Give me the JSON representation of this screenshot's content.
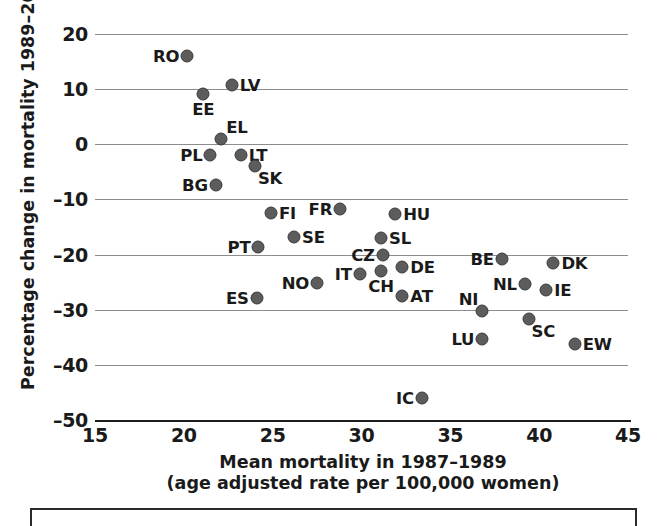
{
  "chart_data": {
    "type": "scatter",
    "title": "",
    "xlabel": "Mean mortality in 1987–1989",
    "xlabel2": "(age adjusted rate per 100,000 women)",
    "ylabel": "Percentage change in mortality 1989–2006",
    "xlim": [
      15,
      45
    ],
    "ylim": [
      -50,
      20
    ],
    "xticks": [
      "15",
      "20",
      "25",
      "30",
      "35",
      "40",
      "45"
    ],
    "yticks": [
      "20",
      "10",
      "0",
      "–10",
      "–20",
      "–30",
      "–40",
      "–50"
    ],
    "grid": "horizontal",
    "legend": "none",
    "marker_color": "#5c5c5c",
    "points": [
      {
        "label": "RO",
        "x": 20.2,
        "y": 16.0,
        "pos": "left"
      },
      {
        "label": "LV",
        "x": 22.7,
        "y": 10.7,
        "pos": "right"
      },
      {
        "label": "EE",
        "x": 21.1,
        "y": 9.1,
        "pos": "below"
      },
      {
        "label": "EL",
        "x": 22.1,
        "y": 0.9,
        "pos": "above-right"
      },
      {
        "label": "PL",
        "x": 21.5,
        "y": -2.0,
        "pos": "left"
      },
      {
        "label": "LT",
        "x": 23.2,
        "y": -2.0,
        "pos": "right"
      },
      {
        "label": "SK",
        "x": 24.0,
        "y": -3.9,
        "pos": "below-right"
      },
      {
        "label": "BG",
        "x": 21.8,
        "y": -7.3,
        "pos": "left"
      },
      {
        "label": "FI",
        "x": 24.9,
        "y": -12.5,
        "pos": "right"
      },
      {
        "label": "FR",
        "x": 28.8,
        "y": -11.7,
        "pos": "left"
      },
      {
        "label": "HU",
        "x": 31.9,
        "y": -12.6,
        "pos": "right"
      },
      {
        "label": "SE",
        "x": 26.2,
        "y": -16.8,
        "pos": "right"
      },
      {
        "label": "SL",
        "x": 31.1,
        "y": -17.0,
        "pos": "right"
      },
      {
        "label": "PT",
        "x": 24.2,
        "y": -18.6,
        "pos": "left"
      },
      {
        "label": "CZ",
        "x": 31.2,
        "y": -20.0,
        "pos": "left"
      },
      {
        "label": "BE",
        "x": 37.9,
        "y": -20.8,
        "pos": "left"
      },
      {
        "label": "DK",
        "x": 40.8,
        "y": -21.5,
        "pos": "right"
      },
      {
        "label": "DE",
        "x": 32.3,
        "y": -22.3,
        "pos": "right"
      },
      {
        "label": "CH",
        "x": 31.1,
        "y": -23.0,
        "pos": "below"
      },
      {
        "label": "IT",
        "x": 29.9,
        "y": -23.5,
        "pos": "left"
      },
      {
        "label": "NO",
        "x": 27.5,
        "y": -25.2,
        "pos": "left"
      },
      {
        "label": "NL",
        "x": 39.2,
        "y": -25.3,
        "pos": "left"
      },
      {
        "label": "IE",
        "x": 40.4,
        "y": -26.5,
        "pos": "right"
      },
      {
        "label": "AT",
        "x": 32.3,
        "y": -27.6,
        "pos": "right"
      },
      {
        "label": "ES",
        "x": 24.1,
        "y": -27.8,
        "pos": "left"
      },
      {
        "label": "NI",
        "x": 36.8,
        "y": -30.3,
        "pos": "above-left"
      },
      {
        "label": "SC",
        "x": 39.4,
        "y": -31.6,
        "pos": "below-right"
      },
      {
        "label": "LU",
        "x": 36.8,
        "y": -35.4,
        "pos": "left"
      },
      {
        "label": "EW",
        "x": 42.0,
        "y": -36.3,
        "pos": "right"
      },
      {
        "label": "IC",
        "x": 33.4,
        "y": -46.1,
        "pos": "left"
      }
    ]
  }
}
